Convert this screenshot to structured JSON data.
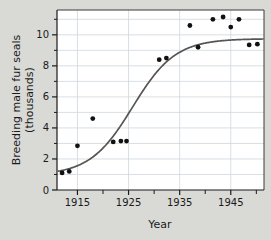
{
  "chart_data": {
    "type": "scatter",
    "title": "",
    "xlabel": "Year",
    "ylabel": "Breeding male fur seals (thousands)",
    "ylabel_line1": "Breeding male fur seals",
    "ylabel_line2": "(thousands)",
    "xlim": [
      1911,
      1951.5
    ],
    "ylim": [
      0,
      11.6
    ],
    "xticks": [
      1915,
      1925,
      1935,
      1945
    ],
    "xtick_labels": [
      "1915",
      "1925",
      "1935",
      "1945"
    ],
    "xminorticks": [
      1920,
      1930,
      1940,
      1950
    ],
    "yticks": [
      0,
      2,
      4,
      6,
      8,
      10
    ],
    "ytick_labels": [
      "0",
      "2",
      "4",
      "6",
      "8",
      "10"
    ],
    "yminorticks": [
      1,
      3,
      5,
      7,
      9,
      11
    ],
    "grid": true,
    "grid_color": "#cfd7dd",
    "legend": "none",
    "point_color": "#111111",
    "point_radius": 2.4,
    "curve_color": "#555555",
    "curve_label": "logistic fit",
    "points": [
      {
        "x": 1912.0,
        "y": 1.1
      },
      {
        "x": 1913.4,
        "y": 1.2
      },
      {
        "x": 1915.0,
        "y": 2.85
      },
      {
        "x": 1918.0,
        "y": 4.6
      },
      {
        "x": 1922.0,
        "y": 3.1
      },
      {
        "x": 1923.5,
        "y": 3.15
      },
      {
        "x": 1924.6,
        "y": 3.15
      },
      {
        "x": 1931.0,
        "y": 8.4
      },
      {
        "x": 1932.4,
        "y": 8.5
      },
      {
        "x": 1937.0,
        "y": 10.6
      },
      {
        "x": 1938.6,
        "y": 9.2
      },
      {
        "x": 1941.5,
        "y": 11.0
      },
      {
        "x": 1943.5,
        "y": 11.15
      },
      {
        "x": 1945.0,
        "y": 10.5
      },
      {
        "x": 1946.6,
        "y": 11.0
      },
      {
        "x": 1948.6,
        "y": 9.35
      },
      {
        "x": 1950.2,
        "y": 9.4
      }
    ],
    "curve": {
      "model": "logistic",
      "asymptote": 9.75,
      "midpoint_year": 1925.8,
      "growth_rate": 0.24,
      "baseline": 0.95,
      "x_start": 1911.3,
      "x_end": 1951.3
    }
  }
}
